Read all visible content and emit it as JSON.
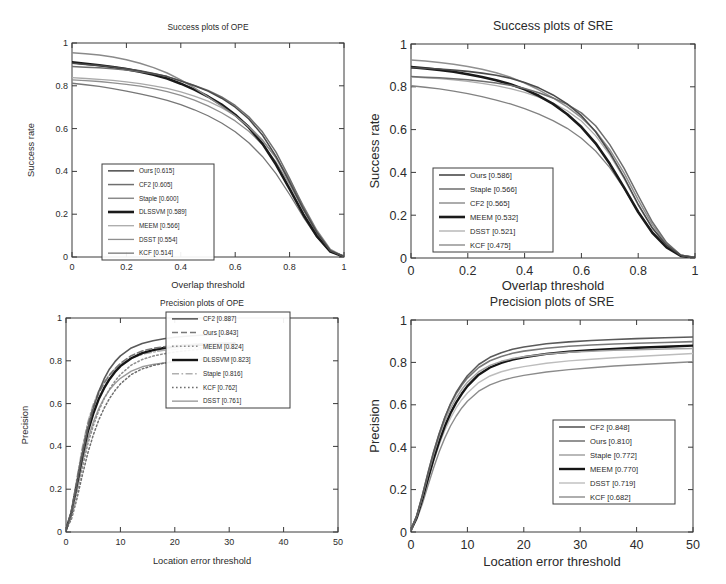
{
  "figure": {
    "background": "#ffffff",
    "panel_count": 4
  },
  "chart_data": [
    {
      "id": "success-ope",
      "type": "line",
      "title": "Success plots of OPE",
      "xlabel": "Overlap threshold",
      "ylabel": "Success rate",
      "xlim": [
        0,
        1
      ],
      "ylim": [
        0,
        1
      ],
      "xticks": [
        "0",
        "0.2",
        "0.4",
        "0.6",
        "0.8",
        "1"
      ],
      "yticks": [
        "0",
        "0.2",
        "0.4",
        "0.6",
        "0.8",
        "1"
      ],
      "grid": false,
      "legend_position": "lower-left",
      "x": [
        0,
        0.05,
        0.1,
        0.15,
        0.2,
        0.25,
        0.3,
        0.35,
        0.4,
        0.45,
        0.5,
        0.55,
        0.6,
        0.65,
        0.7,
        0.75,
        0.8,
        0.85,
        0.9,
        0.95,
        1
      ],
      "series": [
        {
          "name": "Ours",
          "score": "0.615",
          "label": "Ours [0.615]",
          "color": "#4a4a4a",
          "width": 1.5,
          "dash": "none",
          "values": [
            0.905,
            0.9,
            0.895,
            0.888,
            0.88,
            0.87,
            0.858,
            0.843,
            0.822,
            0.8,
            0.775,
            0.742,
            0.7,
            0.645,
            0.57,
            0.47,
            0.35,
            0.225,
            0.115,
            0.03,
            0.002
          ]
        },
        {
          "name": "CF2",
          "score": "0.605",
          "label": "CF2 [0.605]",
          "color": "#6f6f6f",
          "width": 1.5,
          "dash": "none",
          "values": [
            0.89,
            0.887,
            0.884,
            0.88,
            0.874,
            0.866,
            0.856,
            0.843,
            0.824,
            0.802,
            0.778,
            0.748,
            0.708,
            0.655,
            0.585,
            0.49,
            0.368,
            0.235,
            0.118,
            0.03,
            0.002
          ]
        },
        {
          "name": "Staple",
          "score": "0.600",
          "label": "Staple [0.600]",
          "color": "#8a8a8a",
          "width": 1.5,
          "dash": "none",
          "values": [
            0.955,
            0.95,
            0.944,
            0.935,
            0.922,
            0.905,
            0.885,
            0.86,
            0.828,
            0.79,
            0.748,
            0.705,
            0.66,
            0.608,
            0.545,
            0.465,
            0.362,
            0.24,
            0.125,
            0.035,
            0.002
          ]
        },
        {
          "name": "DLSSVM",
          "score": "0.589",
          "label": "DLSSVM [0.589]",
          "color": "#1a1a1a",
          "width": 2.6,
          "dash": "none",
          "values": [
            0.91,
            0.903,
            0.896,
            0.888,
            0.878,
            0.866,
            0.852,
            0.834,
            0.81,
            0.782,
            0.75,
            0.712,
            0.665,
            0.606,
            0.53,
            0.432,
            0.318,
            0.2,
            0.098,
            0.025,
            0.002
          ]
        },
        {
          "name": "MEEM",
          "score": "0.566",
          "label": "MEEM [0.566]",
          "color": "#a9a9a9",
          "width": 1.3,
          "dash": "none",
          "values": [
            0.838,
            0.834,
            0.83,
            0.825,
            0.818,
            0.81,
            0.8,
            0.788,
            0.772,
            0.752,
            0.728,
            0.698,
            0.66,
            0.612,
            0.548,
            0.462,
            0.35,
            0.228,
            0.115,
            0.03,
            0.002
          ]
        },
        {
          "name": "DSST",
          "score": "0.554",
          "label": "DSST [0.554]",
          "color": "#8f8f8f",
          "width": 1.3,
          "dash": "none",
          "values": [
            0.828,
            0.824,
            0.82,
            0.814,
            0.807,
            0.798,
            0.787,
            0.773,
            0.755,
            0.733,
            0.706,
            0.674,
            0.636,
            0.588,
            0.526,
            0.444,
            0.34,
            0.222,
            0.112,
            0.028,
            0.002
          ]
        },
        {
          "name": "KCF",
          "score": "0.514",
          "label": "KCF [0.514]",
          "color": "#777777",
          "width": 1.3,
          "dash": "none",
          "values": [
            0.812,
            0.805,
            0.797,
            0.787,
            0.775,
            0.762,
            0.748,
            0.732,
            0.712,
            0.688,
            0.66,
            0.626,
            0.585,
            0.534,
            0.47,
            0.39,
            0.292,
            0.188,
            0.094,
            0.024,
            0.002
          ]
        }
      ]
    },
    {
      "id": "success-sre",
      "type": "line",
      "title": "Success plots of SRE",
      "xlabel": "Overlap threshold",
      "ylabel": "Success rate",
      "xlim": [
        0,
        1
      ],
      "ylim": [
        0,
        1
      ],
      "xticks": [
        "0",
        "0.2",
        "0.4",
        "0.6",
        "0.8",
        "1"
      ],
      "yticks": [
        "0",
        "0.2",
        "0.4",
        "0.6",
        "0.8",
        "1"
      ],
      "grid": false,
      "legend_position": "lower-left",
      "x": [
        0,
        0.05,
        0.1,
        0.15,
        0.2,
        0.25,
        0.3,
        0.35,
        0.4,
        0.45,
        0.5,
        0.55,
        0.6,
        0.65,
        0.7,
        0.75,
        0.8,
        0.85,
        0.9,
        0.95,
        1
      ],
      "series": [
        {
          "name": "Ours",
          "score": "0.586",
          "label": "Ours [0.586]",
          "color": "#4a4a4a",
          "width": 1.6,
          "dash": "none",
          "values": [
            0.89,
            0.887,
            0.883,
            0.878,
            0.872,
            0.864,
            0.854,
            0.84,
            0.82,
            0.795,
            0.762,
            0.72,
            0.665,
            0.59,
            0.492,
            0.378,
            0.25,
            0.14,
            0.06,
            0.012,
            0.001
          ]
        },
        {
          "name": "Staple",
          "score": "0.566",
          "label": "Staple [0.566]",
          "color": "#6d6d6d",
          "width": 1.5,
          "dash": "none",
          "values": [
            0.848,
            0.845,
            0.842,
            0.838,
            0.833,
            0.826,
            0.818,
            0.807,
            0.792,
            0.772,
            0.748,
            0.718,
            0.678,
            0.618,
            0.53,
            0.42,
            0.292,
            0.168,
            0.072,
            0.014,
            0.001
          ]
        },
        {
          "name": "CF2",
          "score": "0.565",
          "label": "CF2 [0.565]",
          "color": "#909090",
          "width": 1.5,
          "dash": "none",
          "values": [
            0.925,
            0.92,
            0.913,
            0.905,
            0.895,
            0.882,
            0.866,
            0.845,
            0.818,
            0.786,
            0.748,
            0.706,
            0.656,
            0.592,
            0.506,
            0.398,
            0.272,
            0.155,
            0.066,
            0.013,
            0.001
          ]
        },
        {
          "name": "MEEM",
          "score": "0.532",
          "label": "MEEM [0.532]",
          "color": "#1a1a1a",
          "width": 2.6,
          "dash": "none",
          "values": [
            0.892,
            0.886,
            0.879,
            0.87,
            0.859,
            0.846,
            0.831,
            0.812,
            0.788,
            0.758,
            0.72,
            0.672,
            0.612,
            0.536,
            0.44,
            0.33,
            0.215,
            0.118,
            0.05,
            0.01,
            0.001
          ]
        },
        {
          "name": "DSST",
          "score": "0.521",
          "label": "DSST [0.521]",
          "color": "#adadad",
          "width": 1.3,
          "dash": "none",
          "values": [
            0.846,
            0.842,
            0.838,
            0.832,
            0.825,
            0.816,
            0.805,
            0.791,
            0.774,
            0.752,
            0.724,
            0.688,
            0.64,
            0.572,
            0.482,
            0.372,
            0.248,
            0.138,
            0.058,
            0.012,
            0.001
          ]
        },
        {
          "name": "KCF",
          "score": "0.475",
          "label": "KCF [0.475]",
          "color": "#828282",
          "width": 1.3,
          "dash": "none",
          "values": [
            0.805,
            0.798,
            0.79,
            0.78,
            0.768,
            0.754,
            0.738,
            0.72,
            0.698,
            0.672,
            0.642,
            0.606,
            0.56,
            0.5,
            0.422,
            0.325,
            0.215,
            0.12,
            0.05,
            0.01,
            0.001
          ]
        }
      ]
    },
    {
      "id": "precision-ope",
      "type": "line",
      "title": "Precision plots of OPE",
      "xlabel": "Location error threshold",
      "ylabel": "Precision",
      "xlim": [
        0,
        50
      ],
      "ylim": [
        0,
        1
      ],
      "xticks": [
        "0",
        "10",
        "20",
        "30",
        "40",
        "50"
      ],
      "yticks": [
        "0",
        "0.2",
        "0.4",
        "0.6",
        "0.8",
        "1"
      ],
      "grid": false,
      "legend_position": "upper-right",
      "x": [
        0,
        1,
        2,
        3,
        4,
        5,
        6,
        7,
        8,
        9,
        10,
        12,
        14,
        16,
        18,
        20,
        22,
        24,
        26,
        28,
        30,
        31
      ],
      "series": [
        {
          "name": "CF2",
          "score": "0.887",
          "label": "CF2 [0.887]",
          "color": "#5a5a5a",
          "width": 1.6,
          "dash": "none",
          "values": [
            0.01,
            0.09,
            0.22,
            0.36,
            0.48,
            0.575,
            0.655,
            0.715,
            0.762,
            0.796,
            0.823,
            0.86,
            0.881,
            0.894,
            0.903,
            0.91,
            0.915,
            0.918,
            0.921,
            0.923,
            0.925,
            0.926
          ]
        },
        {
          "name": "Ours",
          "score": "0.843",
          "label": "Ours [0.843]",
          "color": "#777777",
          "width": 1.6,
          "dash": "dashed",
          "values": [
            0.01,
            0.1,
            0.24,
            0.38,
            0.5,
            0.585,
            0.648,
            0.695,
            0.733,
            0.763,
            0.788,
            0.824,
            0.846,
            0.858,
            0.866,
            0.871,
            0.875,
            0.878,
            0.88,
            0.882,
            0.884,
            0.885
          ]
        },
        {
          "name": "MEEM",
          "score": "0.824",
          "label": "MEEM [0.824]",
          "color": "#8d8d8d",
          "width": 1.5,
          "dash": "dotted",
          "values": [
            0.01,
            0.07,
            0.18,
            0.3,
            0.41,
            0.495,
            0.565,
            0.622,
            0.668,
            0.705,
            0.736,
            0.78,
            0.806,
            0.822,
            0.833,
            0.841,
            0.847,
            0.852,
            0.855,
            0.858,
            0.861,
            0.862
          ]
        },
        {
          "name": "DLSSVM",
          "score": "0.823",
          "label": "DLSSVM [0.823]",
          "color": "#151515",
          "width": 2.4,
          "dash": "none",
          "values": [
            0.01,
            0.09,
            0.22,
            0.355,
            0.468,
            0.552,
            0.62,
            0.672,
            0.714,
            0.748,
            0.775,
            0.812,
            0.836,
            0.85,
            0.86,
            0.866,
            0.871,
            0.874,
            0.877,
            0.879,
            0.881,
            0.882
          ]
        },
        {
          "name": "Staple",
          "score": "0.816",
          "label": "Staple [0.816]",
          "color": "#b0b0b0",
          "width": 1.5,
          "dash": "dashdot",
          "values": [
            0.01,
            0.1,
            0.25,
            0.395,
            0.512,
            0.596,
            0.657,
            0.702,
            0.736,
            0.762,
            0.783,
            0.812,
            0.83,
            0.841,
            0.849,
            0.854,
            0.858,
            0.861,
            0.863,
            0.865,
            0.866,
            0.867
          ]
        },
        {
          "name": "KCF",
          "score": "0.762",
          "label": "KCF [0.762]",
          "color": "#6e6e6e",
          "width": 1.5,
          "dash": "dotted",
          "values": [
            0.01,
            0.06,
            0.155,
            0.265,
            0.368,
            0.452,
            0.522,
            0.578,
            0.624,
            0.661,
            0.692,
            0.736,
            0.762,
            0.778,
            0.789,
            0.797,
            0.803,
            0.807,
            0.81,
            0.812,
            0.814,
            0.815
          ]
        },
        {
          "name": "DSST",
          "score": "0.761",
          "label": "DSST [0.761]",
          "color": "#9a9a9a",
          "width": 1.4,
          "dash": "none",
          "values": [
            0.01,
            0.08,
            0.2,
            0.325,
            0.432,
            0.512,
            0.576,
            0.626,
            0.664,
            0.694,
            0.718,
            0.752,
            0.772,
            0.783,
            0.79,
            0.795,
            0.799,
            0.802,
            0.804,
            0.806,
            0.807,
            0.808
          ]
        }
      ]
    },
    {
      "id": "precision-sre",
      "type": "line",
      "title": "Precision plots of SRE",
      "xlabel": "Location error threshold",
      "ylabel": "Precision",
      "xlim": [
        0,
        50
      ],
      "ylim": [
        0,
        1
      ],
      "xticks": [
        "0",
        "10",
        "20",
        "30",
        "40",
        "50"
      ],
      "yticks": [
        "0",
        "0.2",
        "0.4",
        "0.6",
        "0.8",
        "1"
      ],
      "grid": false,
      "legend_position": "lower-right",
      "x": [
        0,
        1,
        2,
        3,
        4,
        5,
        6,
        7,
        8,
        9,
        10,
        12,
        14,
        16,
        18,
        20,
        24,
        28,
        32,
        36,
        40,
        45,
        50
      ],
      "series": [
        {
          "name": "CF2",
          "score": "0.848",
          "label": "CF2 [0.848]",
          "color": "#5a5a5a",
          "width": 1.6,
          "dash": "none",
          "values": [
            0.01,
            0.075,
            0.17,
            0.275,
            0.375,
            0.462,
            0.54,
            0.605,
            0.658,
            0.7,
            0.737,
            0.79,
            0.824,
            0.846,
            0.862,
            0.873,
            0.888,
            0.897,
            0.903,
            0.908,
            0.912,
            0.916,
            0.92
          ]
        },
        {
          "name": "Ours",
          "score": "0.810",
          "label": "Ours [0.810]",
          "color": "#787878",
          "width": 1.6,
          "dash": "none",
          "values": [
            0.01,
            0.075,
            0.172,
            0.278,
            0.378,
            0.465,
            0.54,
            0.602,
            0.652,
            0.692,
            0.726,
            0.776,
            0.808,
            0.828,
            0.843,
            0.853,
            0.867,
            0.876,
            0.882,
            0.887,
            0.89,
            0.894,
            0.898
          ]
        },
        {
          "name": "Staple",
          "score": "0.772",
          "label": "Staple [0.772]",
          "color": "#a2a2a2",
          "width": 1.5,
          "dash": "none",
          "values": [
            0.01,
            0.072,
            0.165,
            0.268,
            0.365,
            0.45,
            0.522,
            0.582,
            0.632,
            0.672,
            0.706,
            0.756,
            0.786,
            0.805,
            0.818,
            0.827,
            0.84,
            0.848,
            0.853,
            0.857,
            0.86,
            0.863,
            0.866
          ]
        },
        {
          "name": "MEEM",
          "score": "0.770",
          "label": "MEEM [0.770]",
          "color": "#151515",
          "width": 2.4,
          "dash": "none",
          "values": [
            0.01,
            0.068,
            0.155,
            0.252,
            0.345,
            0.428,
            0.5,
            0.56,
            0.61,
            0.652,
            0.688,
            0.742,
            0.776,
            0.798,
            0.813,
            0.824,
            0.84,
            0.85,
            0.858,
            0.864,
            0.869,
            0.874,
            0.879
          ]
        },
        {
          "name": "DSST",
          "score": "0.719",
          "label": "DSST [0.719]",
          "color": "#bdbdbd",
          "width": 1.4,
          "dash": "none",
          "values": [
            0.01,
            0.065,
            0.148,
            0.242,
            0.332,
            0.412,
            0.48,
            0.537,
            0.585,
            0.624,
            0.656,
            0.705,
            0.736,
            0.756,
            0.77,
            0.78,
            0.796,
            0.807,
            0.815,
            0.822,
            0.828,
            0.835,
            0.842
          ]
        },
        {
          "name": "KCF",
          "score": "0.682",
          "label": "KCF [0.682]",
          "color": "#8b8b8b",
          "width": 1.4,
          "dash": "none",
          "values": [
            0.01,
            0.058,
            0.132,
            0.218,
            0.302,
            0.378,
            0.444,
            0.5,
            0.546,
            0.585,
            0.617,
            0.664,
            0.694,
            0.714,
            0.728,
            0.739,
            0.755,
            0.766,
            0.775,
            0.783,
            0.789,
            0.796,
            0.803
          ]
        }
      ]
    }
  ]
}
